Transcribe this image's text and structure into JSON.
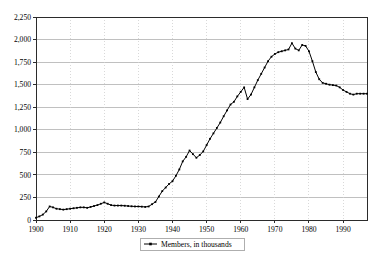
{
  "chart_data": {
    "type": "line",
    "title": "",
    "subtitle": "",
    "xlabel": "",
    "ylabel": "",
    "xlim": [
      1900,
      1997
    ],
    "ylim": [
      0,
      2250
    ],
    "grid": "horizontal-solid-and-vertical-dotted",
    "legend_position": "bottom-center",
    "y_ticks": [
      0,
      250,
      500,
      750,
      1000,
      1250,
      1500,
      1750,
      2000,
      2250
    ],
    "y_tick_labels": [
      "0",
      "250",
      "500",
      "750",
      "1,000",
      "1,250",
      "1,500",
      "1,750",
      "2,000",
      "2,250"
    ],
    "x_ticks": [
      1900,
      1910,
      1920,
      1930,
      1940,
      1950,
      1960,
      1970,
      1980,
      1990
    ],
    "x_tick_labels": [
      "1900",
      "1910",
      "1920",
      "1930",
      "1940",
      "1950",
      "1960",
      "1970",
      "1980",
      "1990"
    ],
    "series": [
      {
        "name": "Members, in thousands",
        "marker": "square-dot",
        "color": "#000000",
        "x": [
          1900,
          1901,
          1902,
          1903,
          1904,
          1905,
          1906,
          1907,
          1908,
          1909,
          1910,
          1911,
          1912,
          1913,
          1914,
          1915,
          1916,
          1917,
          1918,
          1919,
          1920,
          1921,
          1922,
          1923,
          1924,
          1925,
          1926,
          1927,
          1928,
          1929,
          1930,
          1931,
          1932,
          1933,
          1934,
          1935,
          1936,
          1937,
          1938,
          1939,
          1940,
          1941,
          1942,
          1943,
          1944,
          1945,
          1946,
          1947,
          1948,
          1949,
          1950,
          1951,
          1952,
          1953,
          1954,
          1955,
          1956,
          1957,
          1958,
          1959,
          1960,
          1961,
          1962,
          1963,
          1964,
          1965,
          1966,
          1967,
          1968,
          1969,
          1970,
          1971,
          1972,
          1973,
          1974,
          1975,
          1976,
          1977,
          1978,
          1979,
          1980,
          1981,
          1982,
          1983,
          1984,
          1985,
          1986,
          1987,
          1988,
          1989,
          1990,
          1991,
          1992,
          1993,
          1994,
          1995,
          1996,
          1997
        ],
        "values": [
          25,
          40,
          60,
          95,
          150,
          140,
          125,
          120,
          115,
          120,
          125,
          130,
          135,
          140,
          140,
          135,
          145,
          155,
          165,
          180,
          195,
          180,
          165,
          160,
          160,
          160,
          158,
          155,
          152,
          150,
          150,
          148,
          145,
          150,
          175,
          200,
          260,
          320,
          360,
          400,
          430,
          490,
          560,
          650,
          700,
          770,
          730,
          690,
          720,
          760,
          830,
          900,
          960,
          1020,
          1080,
          1150,
          1215,
          1280,
          1310,
          1370,
          1420,
          1470,
          1340,
          1390,
          1470,
          1550,
          1620,
          1690,
          1760,
          1810,
          1840,
          1860,
          1870,
          1880,
          1890,
          1960,
          1900,
          1880,
          1940,
          1930,
          1870,
          1760,
          1640,
          1560,
          1520,
          1510,
          1500,
          1495,
          1490,
          1470,
          1440,
          1420,
          1400,
          1390,
          1400,
          1400,
          1400,
          1400
        ]
      }
    ]
  },
  "legend": {
    "entries": [
      {
        "label": "Members, in thousands"
      }
    ]
  }
}
